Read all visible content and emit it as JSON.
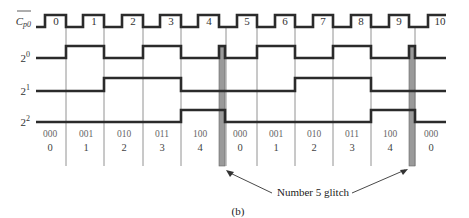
{
  "diagram": {
    "signals": [
      {
        "id": "clock",
        "label": "C",
        "label_sub": "p0",
        "overbar": true
      },
      {
        "id": "bit0",
        "label": "2",
        "exponent": "0"
      },
      {
        "id": "bit1",
        "label": "2",
        "exponent": "1"
      },
      {
        "id": "bit2",
        "label": "2",
        "exponent": "2"
      }
    ],
    "clock_pulses": [
      "0",
      "1",
      "2",
      "3",
      "4",
      "5",
      "6",
      "7",
      "8",
      "9",
      "10"
    ],
    "states_binary": [
      "000",
      "001",
      "010",
      "011",
      "100",
      "000",
      "001",
      "010",
      "011",
      "100",
      "000"
    ],
    "states_decimal": [
      "0",
      "1",
      "2",
      "3",
      "4",
      "0",
      "1",
      "2",
      "3",
      "4",
      "0"
    ],
    "annotation": "Number 5 glitch",
    "caption": "(b)",
    "colors": {
      "signal": "#2b2b2b",
      "glitch": "#9a9a9a",
      "grid": "#777777"
    }
  }
}
